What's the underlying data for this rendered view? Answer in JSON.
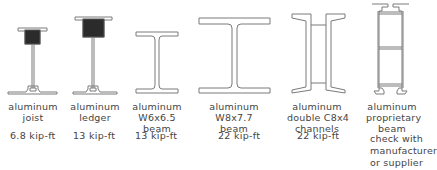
{
  "sections": [
    {
      "id": "joist",
      "lines": [
        "aluminum",
        "joist"
      ],
      "capacity": "6.8 kip-ft",
      "icon": "aluminum-joist-section-icon"
    },
    {
      "id": "ledger",
      "lines": [
        "aluminum",
        "ledger"
      ],
      "capacity": "13 kip-ft",
      "icon": "aluminum-ledger-section-icon"
    },
    {
      "id": "w6x6.5",
      "lines": [
        "aluminum",
        "W6x6.5",
        "beam"
      ],
      "capacity": "13 kip-ft",
      "icon": "w6-beam-section-icon"
    },
    {
      "id": "w8x7.7",
      "lines": [
        "aluminum",
        "W8x7.7",
        "beam"
      ],
      "capacity": "22 kip-ft",
      "icon": "w8-beam-section-icon"
    },
    {
      "id": "double-c8x4",
      "lines": [
        "aluminum",
        "double C8x4",
        "channels"
      ],
      "capacity": "22 kip-ft",
      "icon": "double-channel-section-icon"
    },
    {
      "id": "proprietary",
      "lines": [
        "aluminum",
        "proprietary",
        "beam"
      ],
      "note": [
        "check with",
        "manufacturer",
        "or supplier"
      ],
      "icon": "proprietary-beam-section-icon"
    }
  ],
  "colors": {
    "line": "#6e6e6e",
    "fill": "#2b2b2b",
    "background": "#ffffff"
  }
}
